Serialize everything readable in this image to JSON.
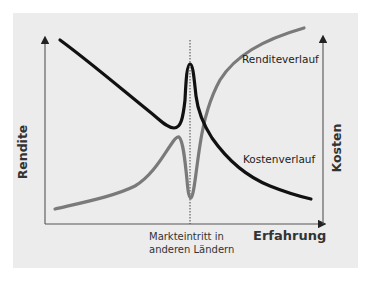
{
  "figure": {
    "x_axis_title": "Erfahrung",
    "y_axis_left_title": "Rendite",
    "y_axis_right_title": "Kosten",
    "event_label_line1": "Markteintritt in",
    "event_label_line2": "anderen Ländern",
    "series_labels": {
      "rendite": "Renditeverlauf",
      "kosten": "Kostenverlauf"
    }
  },
  "colors": {
    "panel_bg": "#ececec",
    "rendite_curve": "#7a7a7a",
    "kosten_curve": "#111111",
    "axis": "#555555"
  }
}
